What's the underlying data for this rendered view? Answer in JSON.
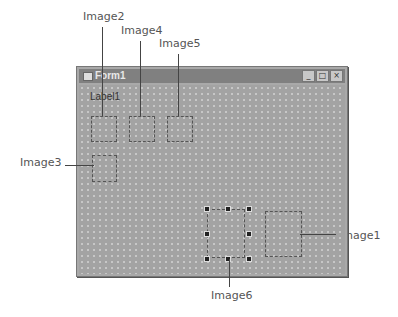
{
  "form": {
    "title": "Form1",
    "label": "Label1",
    "buttons": [
      "_",
      "□",
      "×"
    ]
  },
  "callouts": {
    "image1": "Image1",
    "image2": "Image2",
    "image3": "Image3",
    "image4": "Image4",
    "image5": "Image5",
    "image6": "Image6"
  },
  "icons": {
    "form_icon": "window-icon",
    "minimize": "minimize-icon",
    "maximize": "maximize-icon",
    "close": "close-icon"
  }
}
